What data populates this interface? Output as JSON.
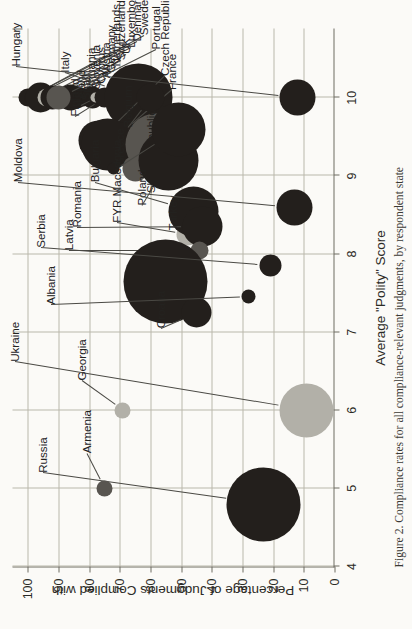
{
  "figure": {
    "caption": "Figure 2. Compliance rates for all compliance-relevant judgments, by respondent state"
  },
  "chart_data": {
    "type": "scatter",
    "title": "",
    "xlabel": "Average \"Polity\" Score",
    "ylabel": "Percentage of Judgments Complied with",
    "xlim": [
      4,
      10.9
    ],
    "ylim": [
      0,
      105
    ],
    "xticks": [
      4,
      5,
      6,
      7,
      8,
      9,
      10
    ],
    "yticks": [
      0,
      10,
      20,
      30,
      40,
      50,
      60,
      70,
      80,
      90,
      100
    ],
    "grid": true,
    "legend": "none",
    "size_encodes": "number of compliance-relevant judgments",
    "colors": {
      "dark": "#231f1c",
      "mid": "#585550",
      "light": "#b2b0a8"
    },
    "points": [
      {
        "name": "Sweden",
        "x": 10.0,
        "y": 100,
        "r": 7,
        "color": "dark",
        "lx": 10.8,
        "ly": 131
      },
      {
        "name": "Denmark, Norway",
        "x": 10.0,
        "y": 100,
        "r": 9,
        "color": "dark",
        "lx": 10.72,
        "ly": 124
      },
      {
        "name": "Luxembourg",
        "x": 10.0,
        "y": 99,
        "r": 6,
        "color": "dark",
        "lx": 10.64,
        "ly": 118
      },
      {
        "name": "UK",
        "x": 10.0,
        "y": 96,
        "r": 15,
        "color": "dark",
        "lx": 10.56,
        "ly": 113
      },
      {
        "name": "Switzerland",
        "x": 10.0,
        "y": 94,
        "r": 9,
        "color": "light",
        "lx": 10.48,
        "ly": 108
      },
      {
        "name": "Netherlands",
        "x": 10.0,
        "y": 92,
        "r": 12,
        "color": "dark",
        "lx": 10.4,
        "ly": 103
      },
      {
        "name": "Germany",
        "x": 10.0,
        "y": 90,
        "r": 8,
        "color": "light",
        "lx": 10.32,
        "ly": 98
      },
      {
        "name": "Austria",
        "x": 10.0,
        "y": 88,
        "r": 10,
        "color": "dark",
        "lx": 10.25,
        "ly": 93
      },
      {
        "name": "Cyprus",
        "x": 10.0,
        "y": 86,
        "r": 13,
        "color": "dark",
        "lx": 10.18,
        "ly": 88
      },
      {
        "name": "Slovenia",
        "x": 10.0,
        "y": 84,
        "r": 11,
        "color": "dark",
        "lx": 10.11,
        "ly": 83
      },
      {
        "name": "Lithuania",
        "x": 10.0,
        "y": 82,
        "r": 9,
        "color": "dark",
        "lx": 10.04,
        "ly": 78
      },
      {
        "name": "Spain",
        "x": 10.0,
        "y": 79,
        "r": 11,
        "color": "dark",
        "lx": 9.97,
        "ly": 73
      },
      {
        "name": "Ireland",
        "x": 10.0,
        "y": 78,
        "r": 5,
        "color": "light",
        "lx": 9.9,
        "ly": 68
      },
      {
        "name": "Finland",
        "x": 10.0,
        "y": 75,
        "r": 10,
        "color": "dark",
        "lx": 9.76,
        "ly": 62
      },
      {
        "name": "Italy",
        "x": 10.0,
        "y": 64,
        "r": 34,
        "color": "dark",
        "lx": 10.32,
        "ly": 52
      },
      {
        "name": "Hungary",
        "x": 10.0,
        "y": 12,
        "r": 18,
        "color": "dark",
        "lx": 10.4,
        "ly": 3
      },
      {
        "name": "Portugal",
        "x": 10.0,
        "y": 90,
        "r": 12,
        "color": "mid",
        "lx": 10.62,
        "ly": 143
      },
      {
        "name": "Czech Republic",
        "x": 9.45,
        "y": 77,
        "r": 20,
        "color": "dark",
        "lx": 10.28,
        "ly": 152
      },
      {
        "name": "France",
        "x": 9.4,
        "y": 74,
        "r": 26,
        "color": "dark",
        "lx": 10.1,
        "ly": 159
      },
      {
        "name": "Estonia",
        "x": 9.1,
        "y": 72,
        "r": 6,
        "color": "dark",
        "lx": 9.4,
        "ly": 155
      },
      {
        "name": "Montenegro",
        "x": 9.1,
        "y": 65,
        "r": 13,
        "color": "mid",
        "lx": 9.0,
        "ly": 146
      },
      {
        "name": "Slovak Republic",
        "x": 9.4,
        "y": 58,
        "r": 31,
        "color": "mid",
        "lx": 8.78,
        "ly": 138
      },
      {
        "name": "Poland",
        "x": 9.2,
        "y": 54,
        "r": 30,
        "color": "dark",
        "lx": 8.62,
        "ly": 129
      },
      {
        "name": "Belgium",
        "x": 10.0,
        "y": 60,
        "r": 14,
        "color": "dark",
        "lx": 9.62,
        "ly": 115
      },
      {
        "name": "Greece",
        "x": 9.6,
        "y": 51,
        "r": 27,
        "color": "dark",
        "lx": 9.12,
        "ly": 107
      },
      {
        "name": "FYR Macedonia",
        "x": 8.25,
        "y": 48,
        "r": 11,
        "color": "light",
        "lx": 8.4,
        "ly": 104
      },
      {
        "name": "Bulgaria",
        "x": 8.55,
        "y": 46,
        "r": 25,
        "color": "dark",
        "lx": 8.92,
        "ly": 82
      },
      {
        "name": "Romania",
        "x": 8.35,
        "y": 43,
        "r": 20,
        "color": "dark",
        "lx": 8.34,
        "ly": 64
      },
      {
        "name": "Latvia",
        "x": 8.05,
        "y": 44,
        "r": 9,
        "color": "mid",
        "lx": 8.05,
        "ly": 56
      },
      {
        "name": "Turkey",
        "x": 7.65,
        "y": 55,
        "r": 42,
        "color": "dark",
        "lx": 8.3,
        "ly": 160
      },
      {
        "name": "Croatia",
        "x": 7.25,
        "y": 45,
        "r": 15,
        "color": "dark",
        "lx": 7.05,
        "ly": 148
      },
      {
        "name": "Albania",
        "x": 7.45,
        "y": 28,
        "r": 7,
        "color": "dark",
        "lx": 7.35,
        "ly": 38
      },
      {
        "name": "Serbia",
        "x": 7.85,
        "y": 21,
        "r": 11,
        "color": "dark",
        "lx": 8.08,
        "ly": 28
      },
      {
        "name": "Moldova",
        "x": 8.6,
        "y": 13,
        "r": 18,
        "color": "dark",
        "lx": 8.92,
        "ly": 5
      },
      {
        "name": "Ukraine",
        "x": 6.0,
        "y": 9,
        "r": 27,
        "color": "light",
        "lx": 6.62,
        "ly": 2
      },
      {
        "name": "Russia",
        "x": 4.8,
        "y": 23,
        "r": 37,
        "color": "dark",
        "lx": 5.2,
        "ly": 30
      },
      {
        "name": "Armenia",
        "x": 5.0,
        "y": 75,
        "r": 8,
        "color": "mid",
        "lx": 5.45,
        "ly": 74
      },
      {
        "name": "Georgia",
        "x": 6.0,
        "y": 69,
        "r": 8,
        "color": "light",
        "lx": 6.38,
        "ly": 69
      }
    ]
  }
}
